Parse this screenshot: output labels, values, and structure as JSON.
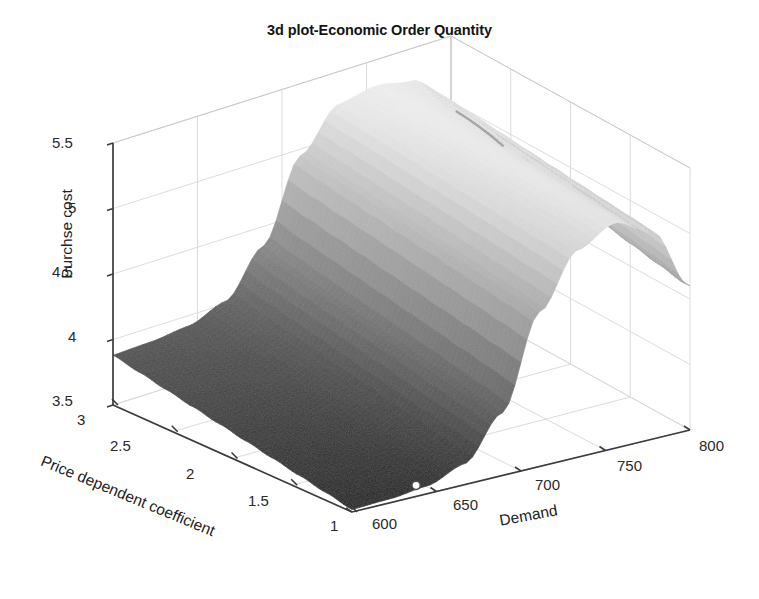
{
  "chart_data": {
    "type": "surface",
    "title": "3d plot-Economic Order Quantity",
    "xlabel": "Price dependent coefficient",
    "ylabel": "Purchse cost",
    "zlabel": "Demand",
    "x_ticks": [
      "3",
      "2.5",
      "2",
      "1.5",
      "1"
    ],
    "x_values": [
      3,
      2.5,
      2,
      1.5,
      1
    ],
    "xlim": [
      3,
      1
    ],
    "z_ticks": [
      "600",
      "650",
      "700",
      "750",
      "800"
    ],
    "z_values": [
      600,
      650,
      700,
      750,
      800
    ],
    "zlim": [
      600,
      800
    ],
    "y_ticks": [
      "3.5",
      "4",
      "4.5",
      "5",
      "5.5"
    ],
    "y_values": [
      3.5,
      4,
      4.5,
      5,
      5.5
    ],
    "ylim": [
      3.5,
      5.5
    ],
    "grid": true,
    "legend": false,
    "colormap": "gray",
    "shading": "interp",
    "marker": {
      "shape": "circle",
      "filled": false,
      "x": 1.1,
      "z": 645,
      "y": 3.52
    },
    "surface_values": [
      [
        3.88,
        3.89,
        3.92,
        4.02,
        4.35,
        4.95,
        5.25,
        5.3,
        5.25,
        4.95
      ],
      [
        3.84,
        3.85,
        3.88,
        3.98,
        4.3,
        4.92,
        5.24,
        5.3,
        5.24,
        4.92
      ],
      [
        3.8,
        3.81,
        3.84,
        3.94,
        4.26,
        4.89,
        5.22,
        5.29,
        5.22,
        4.88
      ],
      [
        3.76,
        3.77,
        3.8,
        3.9,
        4.22,
        4.86,
        5.2,
        5.28,
        5.2,
        4.84
      ],
      [
        3.72,
        3.73,
        3.76,
        3.86,
        4.18,
        4.83,
        5.18,
        5.27,
        5.18,
        4.8
      ],
      [
        3.68,
        3.69,
        3.72,
        3.82,
        4.14,
        4.8,
        5.16,
        5.26,
        5.16,
        4.76
      ],
      [
        3.64,
        3.65,
        3.68,
        3.78,
        4.1,
        4.77,
        5.14,
        5.25,
        5.14,
        4.72
      ],
      [
        3.6,
        3.61,
        3.64,
        3.74,
        4.06,
        4.74,
        5.12,
        5.24,
        5.12,
        4.68
      ],
      [
        3.56,
        3.57,
        3.6,
        3.7,
        4.02,
        4.71,
        5.1,
        5.23,
        5.1,
        4.64
      ],
      [
        3.52,
        3.53,
        3.56,
        3.66,
        3.98,
        4.68,
        5.08,
        5.22,
        5.08,
        4.6
      ]
    ]
  },
  "colors": {
    "axis_line": "#3c3c3c",
    "grid_line": "#d8d8d8",
    "surface_light": "#f2f2f2",
    "surface_dark": "#2b2b2b",
    "text": "#1a1a1a",
    "background": "#ffffff"
  }
}
